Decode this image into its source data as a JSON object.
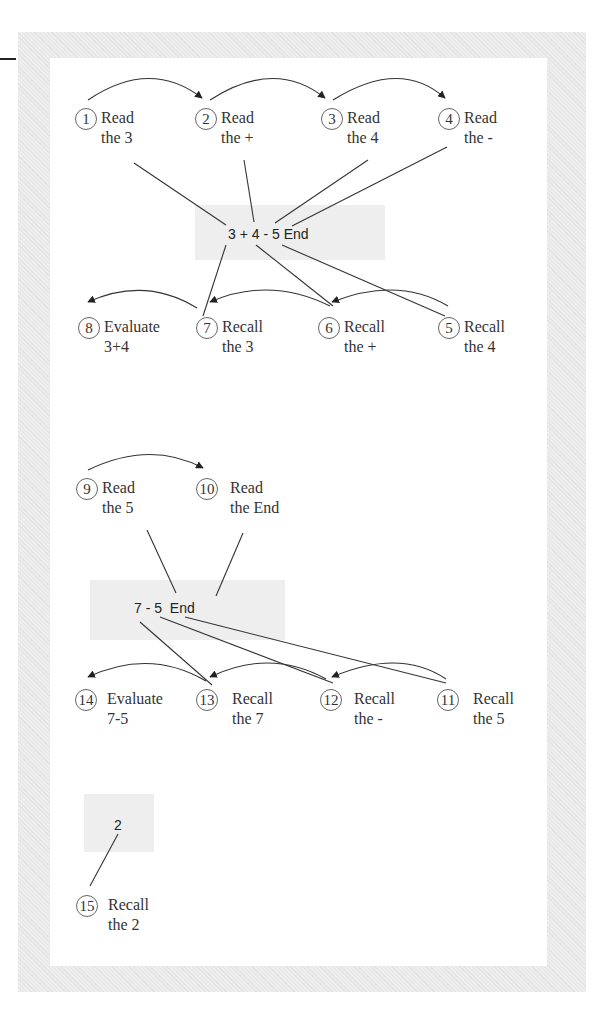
{
  "diagram": {
    "title": "",
    "stages": [
      {
        "expression": "3 + 4 - 5 End",
        "read_nodes": [
          {
            "n": "1",
            "line1": "Read",
            "line2": "the 3"
          },
          {
            "n": "2",
            "line1": "Read",
            "line2": "the +"
          },
          {
            "n": "3",
            "line1": "Read",
            "line2": "the 4"
          },
          {
            "n": "4",
            "line1": "Read",
            "line2": "the -"
          }
        ],
        "recall_nodes": [
          {
            "n": "8",
            "line1": "Evaluate",
            "line2": "3+4"
          },
          {
            "n": "7",
            "line1": "Recall",
            "line2": "the 3"
          },
          {
            "n": "6",
            "line1": "Recall",
            "line2": "the +"
          },
          {
            "n": "5",
            "line1": "Recall",
            "line2": "the 4"
          }
        ]
      },
      {
        "expression": "7 - 5  End",
        "read_nodes": [
          {
            "n": "9",
            "line1": "Read",
            "line2": "the 5"
          },
          {
            "n": "10",
            "line1": "Read",
            "line2": "the End"
          }
        ],
        "recall_nodes": [
          {
            "n": "14",
            "line1": "Evaluate",
            "line2": "7-5"
          },
          {
            "n": "13",
            "line1": "Recall",
            "line2": "the 7"
          },
          {
            "n": "12",
            "line1": "Recall",
            "line2": "the -"
          },
          {
            "n": "11",
            "line1": "Recall",
            "line2": "the 5"
          }
        ]
      },
      {
        "expression": "2",
        "read_nodes": [],
        "recall_nodes": [
          {
            "n": "15",
            "line1": "Recall",
            "line2": "the 2"
          }
        ]
      }
    ]
  }
}
